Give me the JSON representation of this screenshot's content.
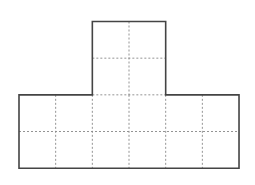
{
  "diagram": {
    "colors": {
      "background": "#ffffff",
      "outline": "#444444",
      "grid": "#888888"
    },
    "grid": {
      "origin_x": 19,
      "origin_y": 21.5,
      "cell": 36.67,
      "stroke_outline": 1.6,
      "stroke_grid": 0.9
    },
    "shape": {
      "top_block": {
        "col_start": 2,
        "cols": 2,
        "row_start": 0,
        "rows": 2
      },
      "bottom_bar": {
        "col_start": 0,
        "cols": 6,
        "row_start": 2,
        "rows": 2
      },
      "total_unit_squares": 16
    }
  }
}
